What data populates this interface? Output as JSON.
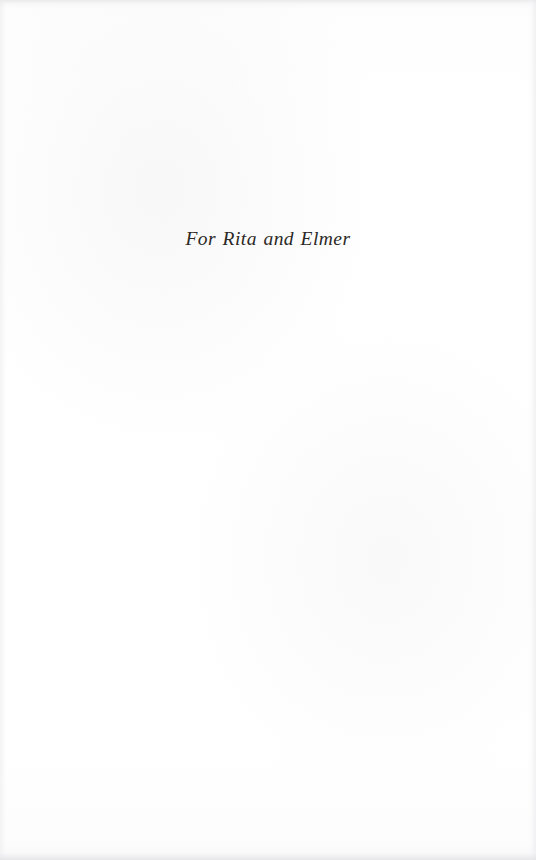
{
  "document": {
    "page_type": "dedication",
    "background_color": "#fefefe",
    "ink_color": "#2c2926"
  },
  "dedication": {
    "text": "For Rita and Elmer"
  }
}
